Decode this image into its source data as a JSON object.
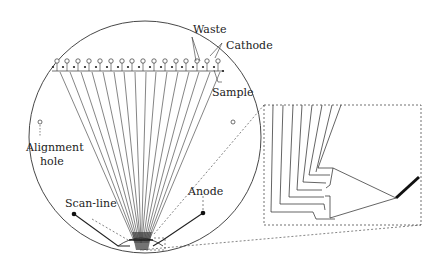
{
  "diagram": {
    "type": "microfluidic-chip-schematic",
    "colors": {
      "stroke": "#2a2a2a",
      "background": "#ffffff"
    },
    "labels": {
      "waste": "Waste",
      "cathode": "Cathode",
      "sample": "Sample",
      "alignment_hole_line1": "Alignment",
      "alignment_hole_line2": "hole",
      "scan_line": "Scan-line",
      "anode": "Anode"
    },
    "chip": {
      "shape": "circular-wafer",
      "reservoir_count": 16,
      "channel_count": 16
    },
    "inset": {
      "description": "magnified view of channel convergence region near anode"
    }
  }
}
